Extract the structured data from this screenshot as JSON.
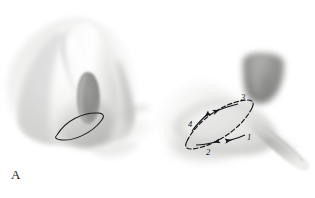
{
  "figure": {
    "panel_label": "A",
    "background_color": "#ffffff",
    "ink_color": "#15161a",
    "skin_tone_light": "#f2f2f1",
    "skin_tone_mid": "#cfcfcd",
    "skin_tone_shadow": "#a9a9a7",
    "nostril_color": "#8d8d8b",
    "instrument_color": "#b9b9b7"
  },
  "left_panel": {
    "name": "nose-overview",
    "label": "A",
    "marking": {
      "name": "fusiform-excision-outline",
      "shape": "lens",
      "stroke": "#1a1a18"
    }
  },
  "right_panel": {
    "name": "ala-closeup",
    "excision": {
      "name": "fusiform-excision-outline",
      "shape": "lens",
      "stroke": "#15161a",
      "dashed": true
    },
    "steps": [
      {
        "number": "1",
        "position": "lower-right",
        "direction": "leftward"
      },
      {
        "number": "2",
        "position": "lower-left",
        "direction": "rightward"
      },
      {
        "number": "3",
        "position": "upper-right",
        "direction": "leftward"
      },
      {
        "number": "4",
        "position": "upper-left",
        "direction": "rightward"
      }
    ],
    "instrument": {
      "name": "forceps",
      "visible": true
    },
    "columella": {
      "name": "columella-shadow",
      "visible": true
    }
  }
}
